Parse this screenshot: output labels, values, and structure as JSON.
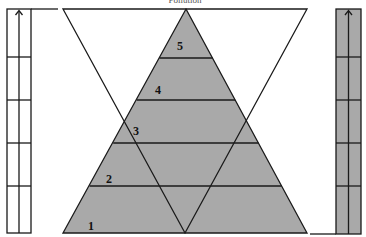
{
  "diagram": {
    "title_partial": "Pollution",
    "pyramid": {
      "fill": "#a9a9a9",
      "stroke": "#1a1a1a",
      "levels": [
        {
          "label": "1",
          "y_top": 186,
          "y_bottom": 233
        },
        {
          "label": "2",
          "y_top": 143,
          "y_bottom": 186
        },
        {
          "label": "3",
          "y_top": 100,
          "y_bottom": 143
        },
        {
          "label": "4",
          "y_top": 58,
          "y_bottom": 100
        },
        {
          "label": "5",
          "y_top": 9,
          "y_bottom": 58
        }
      ]
    },
    "inverted_triangle": {
      "stroke": "#1a1a1a",
      "fill": "none"
    },
    "left_column": {
      "fill": "#ffffff",
      "cells": 5,
      "arrow": "up-arrow"
    },
    "right_column": {
      "fill": "#a9a9a9",
      "cells": 5,
      "arrow": "up-arrow"
    }
  }
}
